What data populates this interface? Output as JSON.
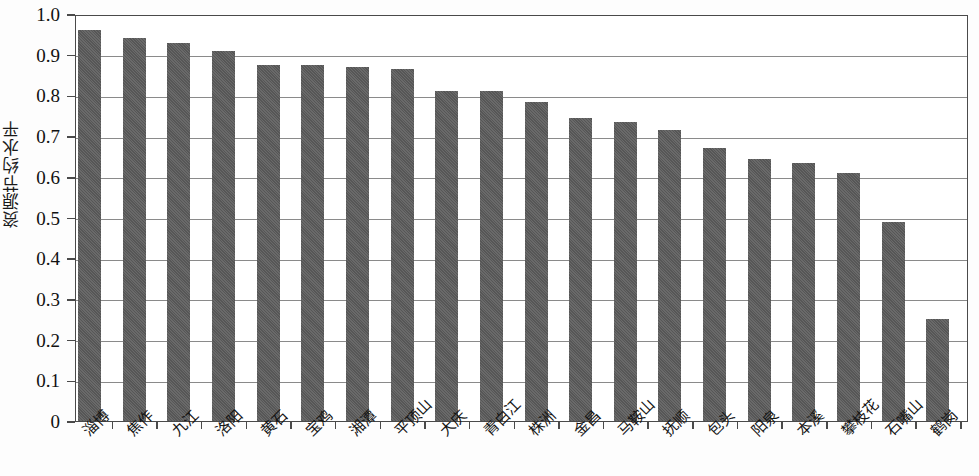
{
  "chart_data": {
    "type": "bar",
    "title": "",
    "xlabel": "",
    "ylabel": "资源节约水平",
    "ylim": [
      0,
      1.0
    ],
    "ytick_labels": [
      "1.0",
      "0.9",
      "0.8",
      "0.7",
      "0.6",
      "0.5",
      "0.4",
      "0.3",
      "0.2",
      "0.1",
      "0"
    ],
    "ytick_values": [
      1.0,
      0.9,
      0.8,
      0.7,
      0.6,
      0.5,
      0.4,
      0.3,
      0.2,
      0.1,
      0
    ],
    "grid": true,
    "legend": false,
    "bar_color": "#5b5b5b",
    "categories": [
      "淄博",
      "焦作",
      "九江",
      "洛阳",
      "黄石",
      "宝鸡",
      "湘潭",
      "平顶山",
      "大庆",
      "青白江",
      "株洲",
      "金昌",
      "马鞍山",
      "抚顺",
      "包头",
      "阳泉",
      "本溪",
      "攀枝花",
      "石嘴山",
      "鹤岗"
    ],
    "values": [
      0.96,
      0.94,
      0.93,
      0.91,
      0.875,
      0.875,
      0.87,
      0.865,
      0.81,
      0.81,
      0.785,
      0.745,
      0.735,
      0.715,
      0.67,
      0.645,
      0.635,
      0.61,
      0.49,
      0.25
    ]
  }
}
